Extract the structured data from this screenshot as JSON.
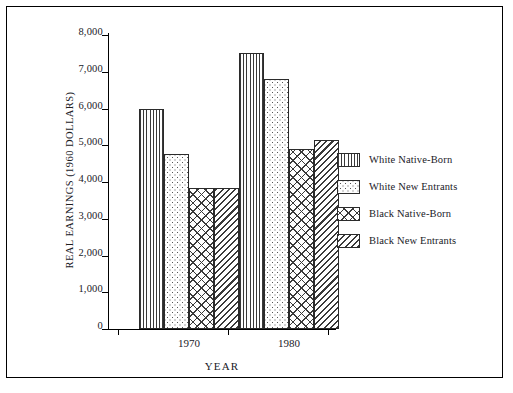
{
  "chart_data": {
    "type": "bar",
    "title": "",
    "xlabel": "YEAR",
    "ylabel": "REAL EARNINGS (1960 DOLLARS)",
    "categories": [
      "1970",
      "1980"
    ],
    "series": [
      {
        "name": "White Native-Born",
        "values": [
          6000,
          7500
        ],
        "pattern": "vertical-lines"
      },
      {
        "name": "White New  Entrants",
        "values": [
          4750,
          6800
        ],
        "pattern": "dots"
      },
      {
        "name": "Black Native-Born",
        "values": [
          3850,
          4900
        ],
        "pattern": "cross-hatch"
      },
      {
        "name": "Black New  Entrants",
        "values": [
          3850,
          5150
        ],
        "pattern": "diagonal-hatch"
      }
    ],
    "ylim": [
      0,
      8000
    ],
    "yticks": [
      "0",
      "1,000",
      "2,000",
      "3,000",
      "4,000",
      "5,000",
      "6,000",
      "7,000",
      "8,000"
    ],
    "ytick_values": [
      0,
      1000,
      2000,
      3000,
      4000,
      5000,
      6000,
      7000,
      8000
    ],
    "grid": false,
    "legend_position": "right"
  },
  "legend": {
    "items": [
      {
        "label": "White Native-Born"
      },
      {
        "label": "White New  Entrants"
      },
      {
        "label": "Black Native-Born"
      },
      {
        "label": "Black New  Entrants"
      }
    ]
  }
}
